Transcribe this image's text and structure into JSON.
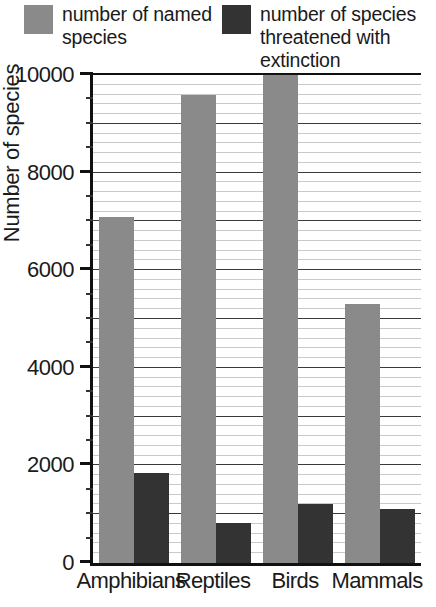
{
  "legend": {
    "entries": [
      {
        "label": "number of named\nspecies",
        "color": "#8a8a8a",
        "swatch_name": "legend-swatch-named-species"
      },
      {
        "label": "number of species\nthreatened with\nextinction",
        "color": "#333333",
        "swatch_name": "legend-swatch-threatened-species"
      }
    ]
  },
  "axis": {
    "y_title": "Number of species",
    "y_ticks": [
      "0",
      "2000",
      "4000",
      "6000",
      "8000",
      "10000"
    ],
    "x_ticks": [
      "Amphibians",
      "Reptiles",
      "Birds",
      "Mammals"
    ]
  },
  "colors": {
    "named_species": "#8a8a8a",
    "threatened_species": "#333333",
    "axis": "#111111",
    "gridline_minor": "#c9c9c9",
    "gridline_major": "#3a3a3a",
    "background": "#ffffff"
  },
  "chart_data": {
    "type": "bar",
    "title": "",
    "xlabel": "",
    "ylabel": "Number of species",
    "categories": [
      "Amphibians",
      "Reptiles",
      "Birds",
      "Mammals"
    ],
    "series": [
      {
        "name": "number of named species",
        "color": "#8a8a8a",
        "values": [
          7100,
          9600,
          10000,
          5300
        ]
      },
      {
        "name": "number of species threatened with extinction",
        "color": "#333333",
        "values": [
          1850,
          820,
          1200,
          1100
        ]
      }
    ],
    "ylim": [
      0,
      10000
    ],
    "ytick_step": 2000,
    "yminor_step": 200,
    "grid": true,
    "legend_position": "top"
  }
}
